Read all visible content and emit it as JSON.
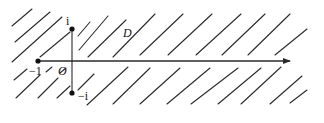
{
  "diagram": {
    "colors": {
      "ink": "#2a2a2a",
      "background": "#ffffff"
    },
    "axis": {
      "x1": 38,
      "y1": 61,
      "x2": 290,
      "y2": 61,
      "arrow": true
    },
    "slit_segment": {
      "x1": 72,
      "y1": 29,
      "x2": 72,
      "y2": 93
    },
    "points": [
      {
        "name": "i",
        "x": 72,
        "y": 29
      },
      {
        "name": "-1",
        "x": 38,
        "y": 61
      },
      {
        "name": "-i",
        "x": 72,
        "y": 93
      }
    ],
    "labels": {
      "i": "i",
      "minus_one": "−1",
      "origin": "O",
      "minus_i": "−i",
      "domain": "D"
    },
    "hatch_lines": [
      [
        12,
        26,
        32,
        9
      ],
      [
        15,
        42,
        50,
        12
      ],
      [
        12,
        62,
        62,
        17
      ],
      [
        40,
        57,
        70,
        32
      ],
      [
        78,
        36,
        90,
        22
      ],
      [
        79,
        50,
        108,
        16
      ],
      [
        88,
        57,
        126,
        20
      ],
      [
        113,
        57,
        155,
        14
      ],
      [
        140,
        55,
        183,
        14
      ],
      [
        168,
        55,
        212,
        14
      ],
      [
        196,
        55,
        241,
        14
      ],
      [
        222,
        55,
        265,
        14
      ],
      [
        248,
        55,
        290,
        14
      ],
      [
        275,
        55,
        307,
        29
      ],
      [
        14,
        80,
        27,
        69
      ],
      [
        46,
        72,
        52,
        67
      ],
      [
        60,
        73,
        66,
        68
      ],
      [
        16,
        98,
        40,
        75
      ],
      [
        38,
        98,
        58,
        78
      ],
      [
        57,
        98,
        70,
        86
      ],
      [
        78,
        90,
        94,
        74
      ],
      [
        87,
        105,
        128,
        67
      ],
      [
        113,
        104,
        150,
        68
      ],
      [
        140,
        104,
        180,
        68
      ],
      [
        167,
        104,
        210,
        68
      ],
      [
        191,
        104,
        238,
        68
      ],
      [
        218,
        104,
        261,
        68
      ],
      [
        241,
        104,
        281,
        67
      ],
      [
        270,
        104,
        302,
        76
      ],
      [
        290,
        103,
        307,
        90
      ]
    ]
  }
}
